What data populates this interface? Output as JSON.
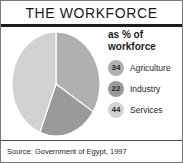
{
  "header": {
    "title": "THE WORKFORCE"
  },
  "legend": {
    "heading": "as % of\nworkforce",
    "items": [
      {
        "value": "34",
        "label": "Agriculture",
        "color": "#b0b0b0"
      },
      {
        "value": "22",
        "label": "Industry",
        "color": "#9a9a9a"
      },
      {
        "value": "44",
        "label": "Services",
        "color": "#d2d2d2"
      }
    ]
  },
  "footer": {
    "source": "Source: Government of Egypt, 1997"
  },
  "chart_data": {
    "type": "pie",
    "title": "THE WORKFORCE",
    "subtitle": "as % of workforce",
    "categories": [
      "Agriculture",
      "Industry",
      "Services"
    ],
    "values": [
      34,
      22,
      44
    ],
    "unit": "%",
    "colors": [
      "#b0b0b0",
      "#9a9a9a",
      "#d2d2d2"
    ],
    "legend_position": "right",
    "start_angle_deg": 0,
    "direction": "clockwise",
    "grid": false,
    "source": "Source: Government of Egypt, 1997"
  }
}
